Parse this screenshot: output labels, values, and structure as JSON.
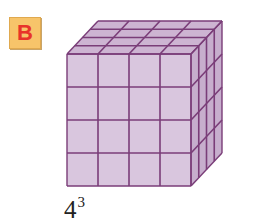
{
  "badge": {
    "letter": "B",
    "bg_color": "#f7c46a",
    "text_color": "#e8332a"
  },
  "cube": {
    "units_per_edge": 4,
    "front_color": "#d9c6de",
    "top_color": "#cdb4d2",
    "side_color": "#c7aecd",
    "line_color": "#7a3d78"
  },
  "label": {
    "base": "4",
    "exponent": "3"
  }
}
